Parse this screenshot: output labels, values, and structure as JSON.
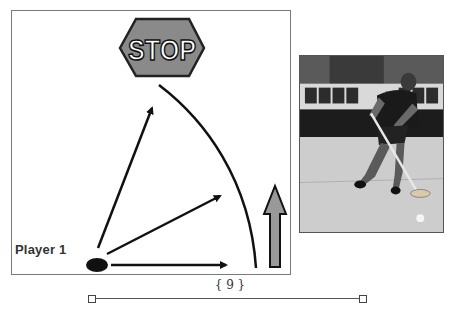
{
  "diagram": {
    "stop_sign": {
      "text": "STOP",
      "fill": "#8a8a8a",
      "stroke": "#222222"
    },
    "player_label": "Player 1",
    "player_marker_color": "#111111",
    "arrows": [
      {
        "name": "arrow-up-left",
        "from": [
          100,
          247
        ],
        "to": [
          153,
          105
        ]
      },
      {
        "name": "arrow-diagonal",
        "from": [
          108,
          253
        ],
        "to": [
          222,
          195
        ]
      },
      {
        "name": "arrow-right",
        "from": [
          111,
          265
        ],
        "to": [
          228,
          265
        ]
      }
    ],
    "curve": {
      "name": "stop-curve",
      "color": "#111111"
    },
    "forward_arrow": {
      "fill": "#999999",
      "stroke": "#111111"
    }
  },
  "photo": {
    "alt": "Floorball player with stick in an indoor hall"
  },
  "footer": {
    "page_number": "9",
    "page_number_decorated": "{ 9 }"
  }
}
